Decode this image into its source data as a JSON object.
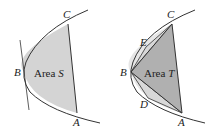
{
  "left_figure": {
    "area_label": "Area",
    "area_var": "S",
    "points": {
      "A": "A",
      "B": "B",
      "C": "C"
    },
    "fill_color": "#d4d4d4"
  },
  "right_figure": {
    "area_label": "Area",
    "area_var": "T",
    "points": {
      "A": "A",
      "B": "B",
      "C": "C",
      "D": "D",
      "E": "E"
    },
    "triangle_fill": "#b0b0b0",
    "small_triangle_fill": "#d8d8d8"
  }
}
